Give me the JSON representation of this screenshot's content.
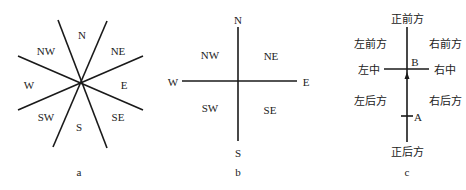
{
  "diagrams": {
    "a": {
      "caption": "a",
      "labels": {
        "n": "N",
        "ne": "NE",
        "e": "E",
        "se": "SE",
        "s": "S",
        "sw": "SW",
        "w": "W",
        "nw": "NW"
      }
    },
    "b": {
      "caption": "b",
      "labels": {
        "n": "N",
        "ne": "NE",
        "e": "E",
        "se": "SE",
        "s": "S",
        "sw": "SW",
        "w": "W",
        "nw": "NW"
      }
    },
    "c": {
      "caption": "c",
      "labels": {
        "front": "正前方",
        "front_left": "左前方",
        "front_right": "右前方",
        "mid_left": "左中",
        "mid_right": "右中",
        "back_left": "左后方",
        "back_right": "右后方",
        "back": "正后方",
        "point_b": "B",
        "point_a": "A"
      }
    }
  },
  "colors": {
    "line": "#1a1a1a",
    "text": "#222222",
    "background": "#ffffff"
  }
}
